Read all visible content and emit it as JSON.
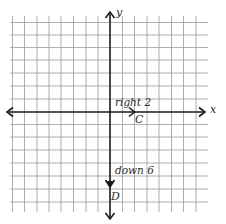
{
  "diagram": {
    "type": "coordinate-plane-translation",
    "axes": {
      "x_label": "x",
      "y_label": "y"
    },
    "grid": {
      "columns": 16,
      "rows": 15,
      "cell_px": 12.2
    },
    "points": [
      {
        "label": "C",
        "description": "origin translated right 2"
      },
      {
        "label": "D",
        "description": "C translated down 6"
      }
    ],
    "moves": [
      {
        "label": "right 2",
        "direction": "right",
        "units": 2
      },
      {
        "label": "down 6",
        "direction": "down",
        "units": 6
      }
    ]
  },
  "colors": {
    "grid": "#9a9a9a",
    "ink": "#1a1a1a",
    "background": "#ffffff"
  }
}
